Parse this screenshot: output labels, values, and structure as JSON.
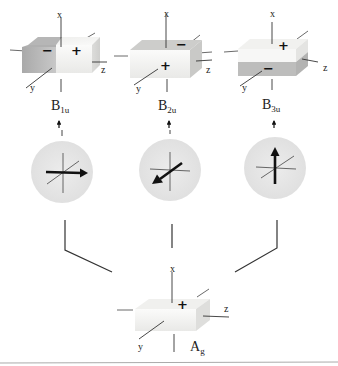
{
  "diagram": {
    "type": "symmetry-mode-diagram",
    "colors": {
      "box_light": "#f4f4f2",
      "box_dark": "#bdbdbd",
      "circle_fill": "#e6e6e6",
      "line": "#333333"
    },
    "top_boxes": [
      {
        "id": "b1u",
        "symbol_main": "B",
        "symbol_sub": "1u",
        "axes": {
          "x": "x",
          "y": "y",
          "z": "z"
        },
        "signs": {
          "left_top": "−",
          "right_top": "+"
        },
        "vector_icon": "arrow-right-along-z"
      },
      {
        "id": "b2u",
        "symbol_main": "B",
        "symbol_sub": "2u",
        "axes": {
          "x": "x",
          "y": "y",
          "z": "z"
        },
        "signs": {
          "back_top": "−",
          "front": "+"
        },
        "vector_icon": "arrow-down-left-along-y"
      },
      {
        "id": "b3u",
        "symbol_main": "B",
        "symbol_sub": "3u",
        "axes": {
          "x": "x",
          "y": "y",
          "z": "z"
        },
        "signs": {
          "top": "+",
          "bottom": "−"
        },
        "vector_icon": "arrow-up-along-x"
      }
    ],
    "bottom_box": {
      "id": "ag",
      "symbol_main": "A",
      "symbol_sub": "g",
      "axes": {
        "x": "x",
        "y": "y",
        "z": "z"
      },
      "signs": {
        "top": "+"
      }
    }
  }
}
